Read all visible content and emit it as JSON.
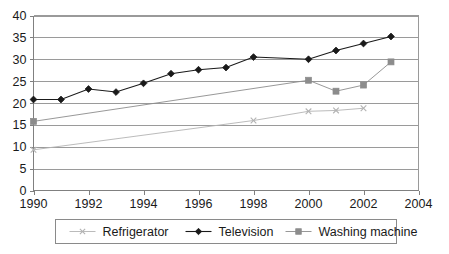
{
  "chart_data": {
    "type": "line",
    "title": "",
    "xlabel": "",
    "ylabel": "",
    "xlim": [
      1990,
      2004
    ],
    "ylim": [
      0,
      40
    ],
    "ytick_step": 5,
    "xtick_step": 2,
    "grid": true,
    "legend_position": "bottom",
    "xticks": [
      "1990",
      "1992",
      "1994",
      "1996",
      "1998",
      "2000",
      "2002",
      "2004"
    ],
    "yticks": [
      "0",
      "5",
      "10",
      "15",
      "20",
      "25",
      "30",
      "35",
      "40"
    ],
    "series": [
      {
        "name": "Refrigerator",
        "color": "#b3b3b3",
        "marker": "x",
        "points": [
          {
            "x": 1990,
            "y": 9.3
          },
          {
            "x": 1998,
            "y": 16.0
          },
          {
            "x": 2000,
            "y": 18.1
          },
          {
            "x": 2001,
            "y": 18.3
          },
          {
            "x": 2002,
            "y": 18.8
          }
        ]
      },
      {
        "name": "Television",
        "color": "#1a1a1a",
        "marker": "diamond",
        "points": [
          {
            "x": 1990,
            "y": 20.8
          },
          {
            "x": 1991,
            "y": 20.8
          },
          {
            "x": 1992,
            "y": 23.2
          },
          {
            "x": 1993,
            "y": 22.5
          },
          {
            "x": 1994,
            "y": 24.5
          },
          {
            "x": 1995,
            "y": 26.7
          },
          {
            "x": 1996,
            "y": 27.6
          },
          {
            "x": 1997,
            "y": 28.1
          },
          {
            "x": 1998,
            "y": 30.5
          },
          {
            "x": 2000,
            "y": 30.0
          },
          {
            "x": 2001,
            "y": 32.0
          },
          {
            "x": 2002,
            "y": 33.6
          },
          {
            "x": 2003,
            "y": 35.2
          }
        ]
      },
      {
        "name": "Washing machine",
        "color": "#8c8c8c",
        "marker": "square",
        "points": [
          {
            "x": 1990,
            "y": 15.8
          },
          {
            "x": 2000,
            "y": 25.2
          },
          {
            "x": 2001,
            "y": 22.7
          },
          {
            "x": 2002,
            "y": 24.1
          },
          {
            "x": 2003,
            "y": 29.4
          }
        ]
      }
    ]
  },
  "legend": {
    "items": [
      {
        "label": "Refrigerator"
      },
      {
        "label": "Television"
      },
      {
        "label": "Washing machine"
      }
    ]
  }
}
